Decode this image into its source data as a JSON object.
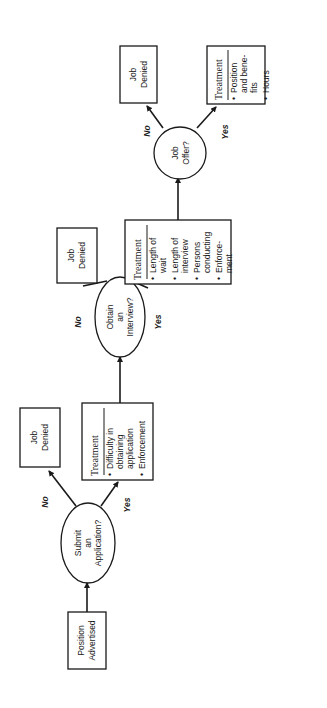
{
  "diagram": {
    "orientation": "rotated-90-ccw",
    "start": {
      "lines": [
        "Position",
        "Advertised"
      ]
    },
    "decisions": [
      {
        "id": "submit",
        "lines": [
          "Submit",
          "an",
          "Application?"
        ],
        "no_label": "No",
        "yes_label": "Yes"
      },
      {
        "id": "interview",
        "lines": [
          "Obtain",
          "an",
          "Interview?"
        ],
        "no_label": "No",
        "yes_label": "Yes"
      },
      {
        "id": "offer",
        "lines": [
          "Job",
          "Offer?"
        ],
        "no_label": "No",
        "yes_label": "Yes"
      }
    ],
    "denied": [
      {
        "lines": [
          "Job",
          "Denied"
        ]
      },
      {
        "lines": [
          "Job",
          "Denied"
        ]
      },
      {
        "lines": [
          "Job",
          "Denied"
        ]
      }
    ],
    "treatments": [
      {
        "header": "Treatment",
        "items": [
          [
            "Difficulty in",
            "obtaining",
            "application"
          ],
          [
            "Enforcement"
          ]
        ]
      },
      {
        "header": "Treatment",
        "items": [
          [
            "Length of",
            "wait"
          ],
          [
            "Length of",
            "interview"
          ],
          [
            "Persons",
            "conducting"
          ],
          [
            "Enforce-",
            "ment"
          ]
        ]
      },
      {
        "header": "Treatment",
        "items": [
          [
            "Position",
            "and bene-",
            "fits"
          ],
          [
            "Hours"
          ]
        ]
      }
    ],
    "bullet": "•"
  }
}
